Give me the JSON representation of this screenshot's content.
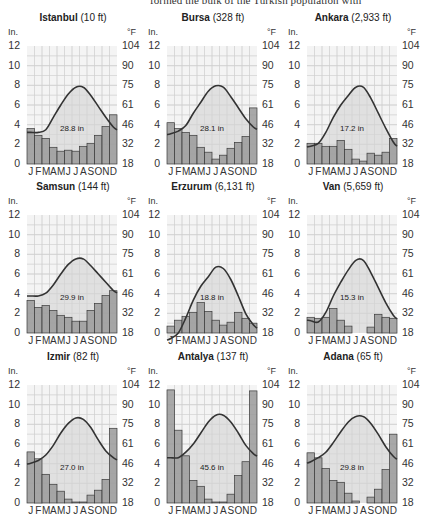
{
  "page": {
    "top_text": "formed the bulk of the Turkish population with"
  },
  "axes": {
    "left_unit": "In.",
    "right_unit": "°F",
    "left_ticks": [
      "12",
      "10",
      "8",
      "6",
      "4",
      "2",
      "0"
    ],
    "right_ticks": [
      "104",
      "90",
      "75",
      "61",
      "46",
      "32",
      "18"
    ],
    "months": [
      "J",
      "F",
      "M",
      "A",
      "M",
      "J",
      "J",
      "A",
      "S",
      "O",
      "N",
      "D"
    ]
  },
  "colors": {
    "bar_fill": "#9a9a9a",
    "bar_stroke": "#3a3a3a",
    "temp_fill": "#d9d9d9",
    "temp_line": "#333333",
    "grid": "#cfcfcf",
    "background": "#f4f4f4"
  },
  "chart_data": [
    {
      "type": "bar+line",
      "title": "Istanbul",
      "elevation": "(10 ft)",
      "total_precip": "28.8 in",
      "categories": [
        "J",
        "F",
        "M",
        "A",
        "M",
        "J",
        "J",
        "A",
        "S",
        "O",
        "N",
        "D"
      ],
      "series": [
        {
          "name": "Precipitation (in)",
          "type": "bar",
          "values": [
            3.6,
            2.9,
            2.6,
            1.7,
            1.3,
            1.4,
            1.3,
            1.8,
            2.1,
            2.9,
            3.8,
            5.0
          ]
        },
        {
          "name": "Temperature (°F)",
          "type": "line",
          "values": [
            41,
            41,
            43,
            52,
            61,
            69,
            74,
            74,
            68,
            60,
            52,
            45
          ]
        }
      ],
      "ylabel_left": "In.",
      "ylabel_right": "°F",
      "ylim_left": [
        0,
        12
      ],
      "ylim_right": [
        18,
        104
      ],
      "grid": true
    },
    {
      "type": "bar+line",
      "title": "Bursa",
      "elevation": "(328 ft)",
      "total_precip": "28.1 in",
      "categories": [
        "J",
        "F",
        "M",
        "A",
        "M",
        "J",
        "J",
        "A",
        "S",
        "O",
        "N",
        "D"
      ],
      "series": [
        {
          "name": "Precipitation (in)",
          "type": "bar",
          "values": [
            4.2,
            3.6,
            3.2,
            2.9,
            1.7,
            1.2,
            0.5,
            0.9,
            1.6,
            2.2,
            2.8,
            5.7
          ]
        },
        {
          "name": "Temperature (°F)",
          "type": "line",
          "values": [
            40,
            42,
            46,
            55,
            63,
            71,
            75,
            74,
            67,
            59,
            51,
            45
          ]
        }
      ],
      "ylabel_left": "In.",
      "ylabel_right": "°F",
      "ylim_left": [
        0,
        12
      ],
      "ylim_right": [
        18,
        104
      ],
      "grid": true
    },
    {
      "type": "bar+line",
      "title": "Ankara",
      "elevation": "(2,933 ft)",
      "total_precip": "17.2 in",
      "categories": [
        "J",
        "F",
        "M",
        "A",
        "M",
        "J",
        "J",
        "A",
        "S",
        "O",
        "N",
        "D"
      ],
      "series": [
        {
          "name": "Precipitation (in)",
          "type": "bar",
          "values": [
            2.1,
            2.1,
            1.8,
            1.8,
            2.4,
            1.5,
            0.5,
            0.3,
            1.1,
            0.9,
            1.2,
            2.6
          ]
        },
        {
          "name": "Temperature (°F)",
          "type": "line",
          "values": [
            31,
            33,
            41,
            52,
            61,
            68,
            74,
            74,
            66,
            55,
            44,
            34
          ]
        }
      ],
      "ylabel_left": "In.",
      "ylabel_right": "°F",
      "ylim_left": [
        0,
        12
      ],
      "ylim_right": [
        18,
        104
      ],
      "grid": true
    },
    {
      "type": "bar+line",
      "title": "Samsun",
      "elevation": "(144 ft)",
      "total_precip": "29.9 in",
      "categories": [
        "J",
        "F",
        "M",
        "A",
        "M",
        "J",
        "J",
        "A",
        "S",
        "O",
        "N",
        "D"
      ],
      "series": [
        {
          "name": "Precipitation (in)",
          "type": "bar",
          "values": [
            3.3,
            2.6,
            2.8,
            2.3,
            1.8,
            1.6,
            1.2,
            1.2,
            2.3,
            3.0,
            3.8,
            4.3
          ]
        },
        {
          "name": "Temperature (°F)",
          "type": "line",
          "values": [
            45,
            45,
            47,
            53,
            61,
            68,
            72,
            72,
            67,
            61,
            55,
            49
          ]
        }
      ],
      "ylabel_left": "In.",
      "ylabel_right": "°F",
      "ylim_left": [
        0,
        12
      ],
      "ylim_right": [
        18,
        104
      ],
      "grid": true
    },
    {
      "type": "bar+line",
      "title": "Erzurum",
      "elevation": "(6,131 ft)",
      "total_precip": "18.8 in",
      "categories": [
        "J",
        "F",
        "M",
        "A",
        "M",
        "J",
        "J",
        "A",
        "S",
        "O",
        "N",
        "D"
      ],
      "series": [
        {
          "name": "Precipitation (in)",
          "type": "bar",
          "values": [
            0.7,
            1.3,
            1.7,
            2.1,
            3.1,
            2.2,
            1.3,
            0.8,
            1.1,
            2.1,
            1.5,
            1.0
          ]
        },
        {
          "name": "Temperature (°F)",
          "type": "line",
          "values": [
            14,
            18,
            29,
            42,
            52,
            59,
            66,
            65,
            57,
            45,
            32,
            24
          ]
        }
      ],
      "ylabel_left": "In.",
      "ylabel_right": "°F",
      "ylim_left": [
        0,
        12
      ],
      "ylim_right": [
        18,
        104
      ],
      "grid": true
    },
    {
      "type": "bar+line",
      "title": "Van",
      "elevation": "(5,659 ft)",
      "total_precip": "15.3 in",
      "categories": [
        "J",
        "F",
        "M",
        "A",
        "M",
        "J",
        "J",
        "A",
        "S",
        "O",
        "N",
        "D"
      ],
      "series": [
        {
          "name": "Precipitation (in)",
          "type": "bar",
          "values": [
            1.6,
            1.5,
            1.6,
            2.5,
            1.3,
            0.7,
            0.0,
            0.0,
            0.6,
            1.9,
            1.6,
            1.5
          ]
        },
        {
          "name": "Temperature (°F)",
          "type": "line",
          "values": [
            27,
            26,
            33,
            45,
            55,
            64,
            71,
            71,
            62,
            51,
            40,
            31
          ]
        }
      ],
      "ylabel_left": "In.",
      "ylabel_right": "°F",
      "ylim_left": [
        0,
        12
      ],
      "ylim_right": [
        18,
        104
      ],
      "grid": true
    },
    {
      "type": "bar+line",
      "title": "Izmir",
      "elevation": "(82 ft)",
      "total_precip": "27.0 in",
      "categories": [
        "J",
        "F",
        "M",
        "A",
        "M",
        "J",
        "J",
        "A",
        "S",
        "O",
        "N",
        "D"
      ],
      "series": [
        {
          "name": "Precipitation (in)",
          "type": "bar",
          "values": [
            5.2,
            4.5,
            2.9,
            1.9,
            1.2,
            0.4,
            0.1,
            0.1,
            0.8,
            1.3,
            2.4,
            7.6
          ]
        },
        {
          "name": "Temperature (°F)",
          "type": "line",
          "values": [
            47,
            49,
            53,
            60,
            69,
            76,
            80,
            79,
            73,
            64,
            56,
            51
          ]
        }
      ],
      "ylabel_left": "In.",
      "ylabel_right": "°F",
      "ylim_left": [
        0,
        12
      ],
      "ylim_right": [
        18,
        104
      ],
      "grid": true
    },
    {
      "type": "bar+line",
      "title": "Antalya",
      "elevation": "(137 ft)",
      "total_precip": "45.6 in",
      "categories": [
        "J",
        "F",
        "M",
        "A",
        "M",
        "J",
        "J",
        "A",
        "S",
        "O",
        "N",
        "D"
      ],
      "series": [
        {
          "name": "Precipitation (in)",
          "type": "bar",
          "values": [
            11.5,
            7.4,
            4.8,
            2.3,
            1.7,
            0.4,
            0.1,
            0.1,
            0.9,
            2.8,
            4.2,
            11.4
          ]
        },
        {
          "name": "Temperature (°F)",
          "type": "line",
          "values": [
            51,
            51,
            55,
            61,
            69,
            77,
            82,
            82,
            77,
            69,
            60,
            54
          ]
        }
      ],
      "ylabel_left": "In.",
      "ylabel_right": "°F",
      "ylim_left": [
        0,
        12
      ],
      "ylim_right": [
        18,
        104
      ],
      "grid": true
    },
    {
      "type": "bar+line",
      "title": "Adana",
      "elevation": "(65 ft)",
      "total_precip": "29.8 in",
      "categories": [
        "J",
        "F",
        "M",
        "A",
        "M",
        "J",
        "J",
        "A",
        "S",
        "O",
        "N",
        "D"
      ],
      "series": [
        {
          "name": "Precipitation (in)",
          "type": "bar",
          "values": [
            5.1,
            4.6,
            3.5,
            2.3,
            2.1,
            1.0,
            0.2,
            0.0,
            0.6,
            1.4,
            3.4,
            7.0
          ]
        },
        {
          "name": "Temperature (°F)",
          "type": "line",
          "values": [
            48,
            51,
            55,
            62,
            70,
            77,
            81,
            81,
            76,
            68,
            59,
            52
          ]
        }
      ],
      "ylabel_left": "In.",
      "ylabel_right": "°F",
      "ylim_left": [
        0,
        12
      ],
      "ylim_right": [
        18,
        104
      ],
      "grid": true
    }
  ]
}
